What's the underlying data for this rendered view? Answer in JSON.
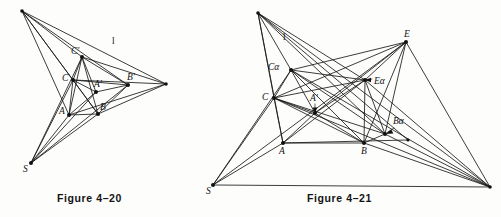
{
  "page": {
    "background_color": "#fdfdfc",
    "ink_color": "#111111",
    "kind": "textbook-geometry-figure-pair"
  },
  "figures": [
    {
      "id": "figure-4-20",
      "caption": "Figure 4–20",
      "line_label": "l",
      "point_labels": [
        "C'",
        "C",
        "A'",
        "B'",
        "A",
        "B",
        "S"
      ],
      "points": {
        "P": {
          "x": 22,
          "y": 11,
          "label": "",
          "dot": true
        },
        "Q": {
          "x": 166,
          "y": 84,
          "label": "",
          "dot": true
        },
        "Cp": {
          "x": 82,
          "y": 57,
          "label": "C'",
          "lx": -11,
          "ly": -3
        },
        "C": {
          "x": 73,
          "y": 80,
          "label": "C",
          "lx": -11,
          "ly": 1
        },
        "Ap": {
          "x": 96,
          "y": 92,
          "label": "A'",
          "lx": -2,
          "ly": -5
        },
        "Bp": {
          "x": 128,
          "y": 85,
          "label": "B'",
          "lx": -1,
          "ly": -5
        },
        "A": {
          "x": 69,
          "y": 115,
          "label": "A",
          "lx": -10,
          "ly": -1
        },
        "B": {
          "x": 98,
          "y": 114,
          "label": "B",
          "lx": 2,
          "ly": -4
        },
        "S": {
          "x": 31,
          "y": 163,
          "label": "S",
          "lx": -8,
          "ly": 9
        }
      },
      "line_label_pos": {
        "x": 112,
        "y": 44
      }
    },
    {
      "id": "figure-4-21",
      "caption": "Figure 4–21",
      "line_label": "l",
      "point_labels": [
        "Cα",
        "C",
        "A'",
        "Eα",
        "Bα",
        "E",
        "A",
        "B",
        "S"
      ],
      "points": {
        "P": {
          "x": 53,
          "y": 13,
          "label": "",
          "dot": true
        },
        "Q": {
          "x": 285,
          "y": 187,
          "label": "",
          "dot": true
        },
        "Ca": {
          "x": 86,
          "y": 70,
          "label": "Cα",
          "lx": -20,
          "ly": 0
        },
        "C": {
          "x": 69,
          "y": 98,
          "label": "C",
          "lx": -11,
          "ly": 1
        },
        "Ap": {
          "x": 110,
          "y": 113,
          "label": "A'",
          "lx": -3,
          "ly": -12
        },
        "Ea": {
          "x": 160,
          "y": 80,
          "label": "Eα",
          "lx": 9,
          "ly": 4
        },
        "Ba": {
          "x": 180,
          "y": 134,
          "label": "Bα",
          "lx": 8,
          "ly": -10
        },
        "E": {
          "x": 201,
          "y": 42,
          "label": "E",
          "lx": -2,
          "ly": -5
        },
        "A": {
          "x": 78,
          "y": 143,
          "label": "A",
          "lx": -4,
          "ly": 11
        },
        "B": {
          "x": 159,
          "y": 143,
          "label": "B",
          "lx": -3,
          "ly": 11
        },
        "S": {
          "x": 8,
          "y": 185,
          "label": "S",
          "lx": -7,
          "ly": 9
        },
        "R": {
          "x": 203,
          "y": 140,
          "label": "",
          "dot": true
        }
      },
      "line_label_pos": {
        "x": 78,
        "y": 40
      }
    }
  ]
}
